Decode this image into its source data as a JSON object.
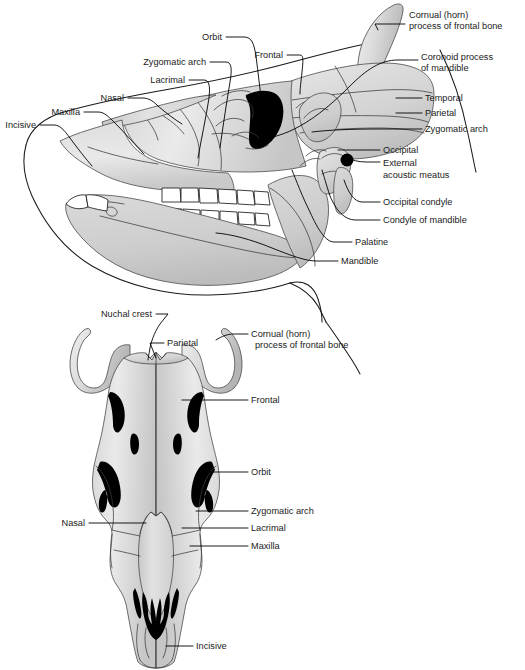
{
  "figure": {
    "colors": {
      "bone_light": "#e6e6e6",
      "bone_mid": "#d2d2d2",
      "bone_shadow": "#b8b8b8",
      "cavity_black": "#000000",
      "outline": "#1a1a1a",
      "background": "#ffffff"
    },
    "views": [
      {
        "name": "lateral-view",
        "position": "top"
      },
      {
        "name": "dorsal-view",
        "position": "bottom"
      }
    ]
  },
  "lateral_view": {
    "name": "lateral-view",
    "labels": [
      {
        "id": "cornual-process",
        "text_lines": [
          "Cornual (horn)",
          "process of frontal bone"
        ],
        "x": 409,
        "y": 18,
        "anchor": "start"
      },
      {
        "id": "coronoid-process",
        "text_lines": [
          "Coronoid process",
          "of mandible"
        ],
        "x": 421,
        "y": 60,
        "anchor": "start"
      },
      {
        "id": "temporal",
        "text_lines": [
          "Temporal"
        ],
        "x": 425,
        "y": 98,
        "anchor": "start"
      },
      {
        "id": "parietal",
        "text_lines": [
          "Parietal"
        ],
        "x": 425,
        "y": 113,
        "anchor": "start"
      },
      {
        "id": "zygomatic-arch-r",
        "text_lines": [
          "Zygomatic arch"
        ],
        "x": 425,
        "y": 129,
        "anchor": "start"
      },
      {
        "id": "occipital",
        "text_lines": [
          "Occipital"
        ],
        "x": 383,
        "y": 150,
        "anchor": "start"
      },
      {
        "id": "external-acoustic-meatus",
        "text_lines": [
          "External",
          "acoustic meatus"
        ],
        "x": 383,
        "y": 168,
        "anchor": "start"
      },
      {
        "id": "occipital-condyle",
        "text_lines": [
          "Occipital condyle"
        ],
        "x": 383,
        "y": 202,
        "anchor": "start"
      },
      {
        "id": "condyle-of-mandible",
        "text_lines": [
          "Condyle of mandible"
        ],
        "x": 383,
        "y": 220,
        "anchor": "start"
      },
      {
        "id": "palatine",
        "text_lines": [
          "Palatine"
        ],
        "x": 355,
        "y": 242,
        "anchor": "start"
      },
      {
        "id": "mandible",
        "text_lines": [
          "Mandible"
        ],
        "x": 341,
        "y": 261,
        "anchor": "start"
      },
      {
        "id": "orbit",
        "text_lines": [
          "Orbit"
        ],
        "x": 222,
        "y": 37,
        "anchor": "end"
      },
      {
        "id": "frontal",
        "text_lines": [
          "Frontal"
        ],
        "x": 283,
        "y": 55,
        "anchor": "end"
      },
      {
        "id": "zygomatic-arch-l",
        "text_lines": [
          "Zygomatic arch"
        ],
        "x": 206,
        "y": 62,
        "anchor": "end"
      },
      {
        "id": "lacrimal",
        "text_lines": [
          "Lacrimal"
        ],
        "x": 185,
        "y": 80,
        "anchor": "end"
      },
      {
        "id": "nasal",
        "text_lines": [
          "Nasal"
        ],
        "x": 124,
        "y": 98,
        "anchor": "end"
      },
      {
        "id": "maxilla",
        "text_lines": [
          "Maxilla"
        ],
        "x": 80,
        "y": 112,
        "anchor": "end"
      },
      {
        "id": "incisive",
        "text_lines": [
          "Incisive"
        ],
        "x": 36,
        "y": 125,
        "anchor": "end"
      }
    ]
  },
  "dorsal_view": {
    "name": "dorsal-view",
    "labels": [
      {
        "id": "nuchal-crest",
        "text_lines": [
          "Nuchal crest"
        ],
        "x": 152,
        "y": 317,
        "anchor": "end"
      },
      {
        "id": "parietal-d",
        "text_lines": [
          "Parietal"
        ],
        "x": 167,
        "y": 343,
        "anchor": "start"
      },
      {
        "id": "cornual-process-d",
        "text_lines": [
          "Cornual (horn)",
          "process of frontal bone"
        ],
        "x": 251,
        "y": 340,
        "anchor": "start"
      },
      {
        "id": "frontal-d",
        "text_lines": [
          "Frontal"
        ],
        "x": 251,
        "y": 400,
        "anchor": "start"
      },
      {
        "id": "orbit-d",
        "text_lines": [
          "Orbit"
        ],
        "x": 251,
        "y": 472,
        "anchor": "start"
      },
      {
        "id": "zygomatic-arch-d",
        "text_lines": [
          "Zygomatic arch"
        ],
        "x": 251,
        "y": 511,
        "anchor": "start"
      },
      {
        "id": "lacrimal-d",
        "text_lines": [
          "Lacrimal"
        ],
        "x": 251,
        "y": 528,
        "anchor": "start"
      },
      {
        "id": "maxilla-d",
        "text_lines": [
          "Maxilla"
        ],
        "x": 251,
        "y": 546,
        "anchor": "start"
      },
      {
        "id": "nasal-d",
        "text_lines": [
          "Nasal"
        ],
        "x": 85,
        "y": 523,
        "anchor": "end"
      },
      {
        "id": "incisive-d",
        "text_lines": [
          "Incisive"
        ],
        "x": 196,
        "y": 646,
        "anchor": "start"
      }
    ]
  }
}
